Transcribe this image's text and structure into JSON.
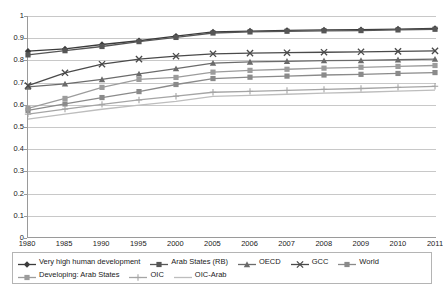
{
  "chart_data": {
    "type": "line",
    "title": "",
    "subtitle": "",
    "xlabel": "",
    "ylabel": "",
    "ylim": [
      0,
      1
    ],
    "ytick_labels": [
      "1",
      "0.9",
      "0.8",
      "0.7",
      "0.6",
      "0.5",
      "0.4",
      "0.3",
      "0.2",
      "0.1",
      "0"
    ],
    "ytick_values": [
      1,
      0.9,
      0.8,
      0.7,
      0.6,
      0.5,
      0.4,
      0.3,
      0.2,
      0.1,
      0
    ],
    "grid": true,
    "legend_position": "bottom",
    "categories": [
      "1980",
      "1985",
      "1990",
      "1995",
      "2000",
      "2005",
      "2006",
      "2007",
      "2008",
      "2009",
      "2010",
      "2011"
    ],
    "series": [
      {
        "name": "Very high human development",
        "marker": "diamond",
        "color": "#3b3b3b",
        "values": [
          0.841,
          0.851,
          0.871,
          0.888,
          0.909,
          0.928,
          0.932,
          0.935,
          0.937,
          0.938,
          0.941,
          0.944
        ]
      },
      {
        "name": "Arab States (RB)",
        "marker": "square",
        "color": "#565656",
        "values": [
          0.824,
          0.843,
          0.862,
          0.884,
          0.903,
          0.923,
          0.928,
          0.931,
          0.933,
          0.934,
          0.937,
          0.94
        ]
      },
      {
        "name": "OECD",
        "marker": "triangle",
        "color": "#6b6b6b",
        "values": [
          0.679,
          0.693,
          0.713,
          0.738,
          0.762,
          0.787,
          0.792,
          0.795,
          0.798,
          0.799,
          0.802,
          0.805
        ]
      },
      {
        "name": "GCC",
        "marker": "cross",
        "color": "#4a4a4a",
        "values": [
          0.685,
          0.743,
          0.782,
          0.805,
          0.818,
          0.829,
          0.832,
          0.834,
          0.836,
          0.838,
          0.84,
          0.842
        ]
      },
      {
        "name": "World",
        "marker": "square",
        "color": "#8a8a8a",
        "values": [
          0.573,
          0.602,
          0.631,
          0.658,
          0.69,
          0.717,
          0.723,
          0.728,
          0.733,
          0.736,
          0.74,
          0.744
        ]
      },
      {
        "name": "Developing: Arab States",
        "marker": "square",
        "color": "#9c9c9c",
        "values": [
          0.582,
          0.627,
          0.677,
          0.713,
          0.722,
          0.746,
          0.754,
          0.759,
          0.764,
          0.768,
          0.772,
          0.776
        ]
      },
      {
        "name": "OIC",
        "marker": "plus",
        "color": "#a5a5a5",
        "values": [
          0.556,
          0.579,
          0.6,
          0.62,
          0.637,
          0.655,
          0.659,
          0.663,
          0.668,
          0.672,
          0.677,
          0.682
        ]
      },
      {
        "name": "OIC-Arab",
        "marker": "none",
        "color": "#bdbdbd",
        "values": [
          0.533,
          0.556,
          0.578,
          0.597,
          0.614,
          0.636,
          0.641,
          0.646,
          0.651,
          0.655,
          0.66,
          0.665
        ]
      }
    ]
  },
  "legend": {
    "row1": [
      {
        "label": "Very high human development"
      },
      {
        "label": "Arab States (RB)"
      },
      {
        "label": "OECD"
      },
      {
        "label": "GCC"
      },
      {
        "label": "World"
      }
    ],
    "row2": [
      {
        "label": "Developing: Arab States"
      },
      {
        "label": "OIC"
      },
      {
        "label": "OIC-Arab"
      }
    ]
  }
}
